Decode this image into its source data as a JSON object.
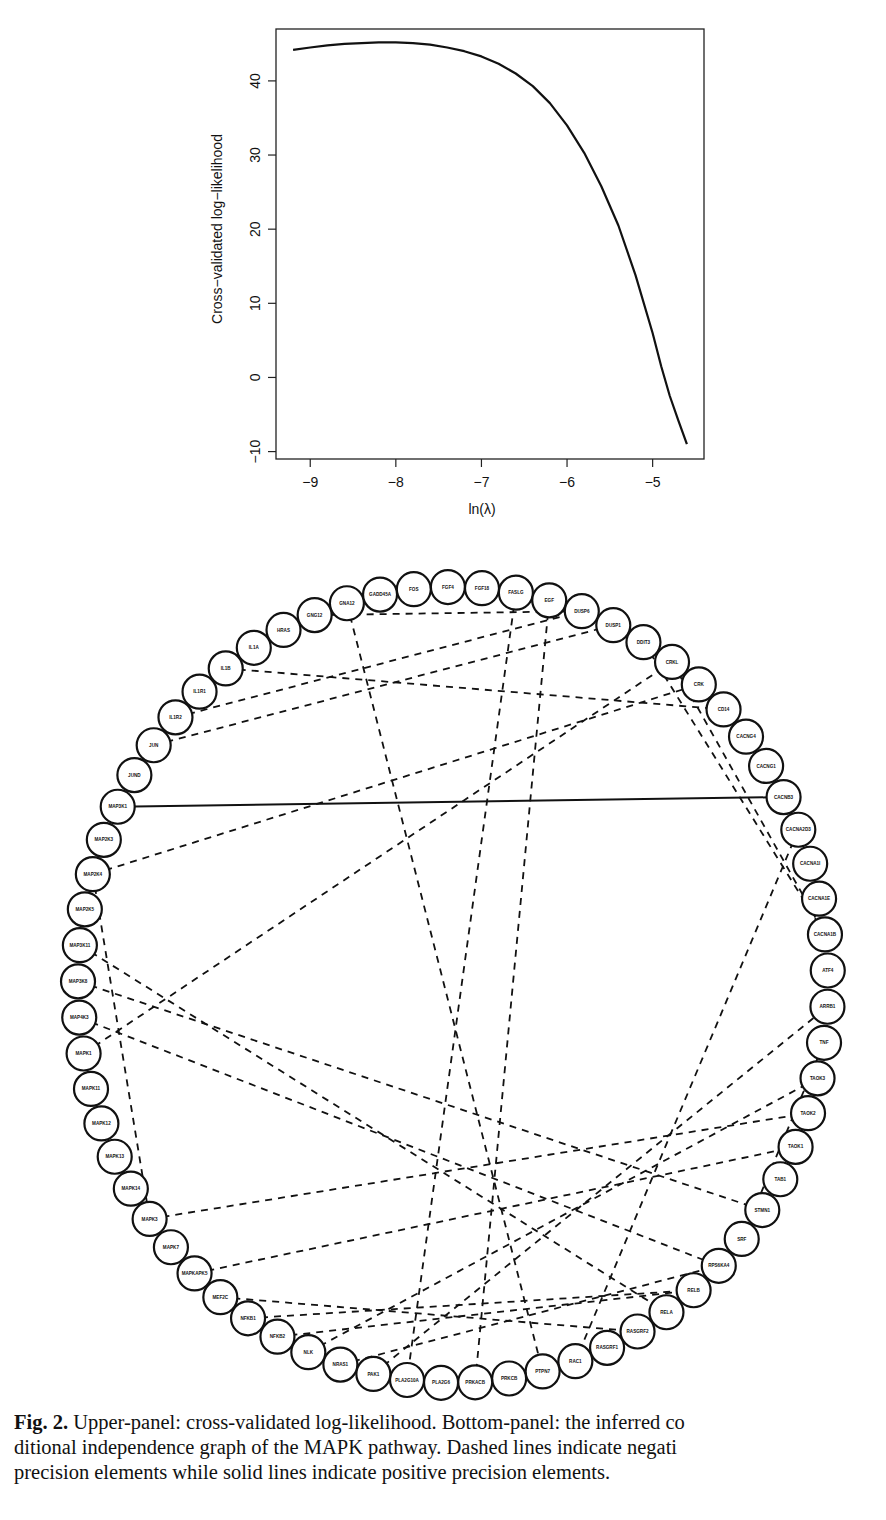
{
  "figure": {
    "label": "Fig. 2.",
    "caption_lines": [
      " Upper-panel: cross-validated log-likelihood. Bottom-panel: the inferred co",
      "ditional independence graph of the MAPK pathway. Dashed lines indicate negati",
      "precision elements while solid lines indicate positive precision elements."
    ]
  },
  "chart_data": [
    {
      "type": "line",
      "title": "",
      "xlabel": "ln(λ)",
      "ylabel": "Cross−validated log−likelihood",
      "xlim": [
        -9.4,
        -4.4
      ],
      "ylim": [
        -11,
        47
      ],
      "xticks": [
        -9,
        -8,
        -7,
        -6,
        -5
      ],
      "xtick_labels": [
        "−9",
        "−8",
        "−7",
        "−6",
        "−5"
      ],
      "yticks": [
        -10,
        0,
        10,
        20,
        30,
        40
      ],
      "ytick_labels": [
        "−10",
        "0",
        "10",
        "20",
        "30",
        "40"
      ],
      "grid": false,
      "series": [
        {
          "name": "cv-loglik",
          "x": [
            -9.2,
            -9.0,
            -8.8,
            -8.6,
            -8.4,
            -8.2,
            -8.0,
            -7.8,
            -7.6,
            -7.4,
            -7.2,
            -7.0,
            -6.8,
            -6.6,
            -6.4,
            -6.2,
            -6.0,
            -5.8,
            -5.6,
            -5.4,
            -5.2,
            -5.0,
            -4.9,
            -4.8,
            -4.7,
            -4.6
          ],
          "y": [
            44.2,
            44.5,
            44.8,
            45.0,
            45.1,
            45.2,
            45.2,
            45.1,
            44.9,
            44.5,
            44.0,
            43.3,
            42.3,
            41.0,
            39.3,
            37.0,
            34.0,
            30.3,
            25.8,
            20.5,
            13.8,
            6.0,
            1.5,
            -2.5,
            -5.8,
            -9.0
          ]
        }
      ]
    },
    {
      "type": "network",
      "title": "Conditional independence graph of the MAPK pathway",
      "legend": {
        "dashed": "negative precision elements",
        "solid": "positive precision elements"
      },
      "nodes": [
        "FOS",
        "FGF4",
        "FGF18",
        "FASLG",
        "EGF",
        "DUSP6",
        "DUSP1",
        "DDIT3",
        "CRKL",
        "CRK",
        "CD14",
        "CACNG4",
        "CACNG1",
        "CACNB3",
        "CACNA2D3",
        "CACNA1I",
        "CACNA1E",
        "CACNA1B",
        "ATF4",
        "ARRB1",
        "TNF",
        "TAOK3",
        "TAOK2",
        "TAOK1",
        "TAB1",
        "STMN1",
        "SRF",
        "RPS6KA4",
        "RELB",
        "RELA",
        "RASGRF2",
        "RASGRF1",
        "RAC1",
        "PTPN7",
        "PRKCB",
        "PRKACB",
        "PLA2G6",
        "PLA2G10A",
        "PAK1",
        "NRAS1",
        "NLK",
        "NFKB2",
        "NFKB1",
        "MEF2C",
        "MAPKAPK5",
        "MAPK7",
        "MAPK3",
        "MAPK14",
        "MAPK13",
        "MAPK12",
        "MAPK11",
        "MAPK1",
        "MAP4K3",
        "MAP3K8",
        "MAP3K11",
        "MAP2K5",
        "MAP2K4",
        "MAP2K3",
        "MAP3K1",
        "JUND",
        "JUN",
        "IL1R2",
        "IL1R1",
        "IL1B",
        "IL1A",
        "HRAS",
        "GNG12",
        "GNA12",
        "GADD45A"
      ],
      "edges": [
        {
          "from": "MAP3K1",
          "to": "CACNB3",
          "style": "solid"
        },
        {
          "from": "GNG12",
          "to": "DUSP6",
          "style": "dashed"
        },
        {
          "from": "GNA12",
          "to": "PTPN7",
          "style": "dashed"
        },
        {
          "from": "FGF4",
          "to": "DUSP6",
          "style": "dashed"
        },
        {
          "from": "FASLG",
          "to": "PLA2G10A",
          "style": "dashed"
        },
        {
          "from": "EGF",
          "to": "PRKACB",
          "style": "dashed"
        },
        {
          "from": "IL1B",
          "to": "CD14",
          "style": "dashed"
        },
        {
          "from": "IL1R2",
          "to": "DUSP6",
          "style": "dashed"
        },
        {
          "from": "JUN",
          "to": "DUSP1",
          "style": "dashed"
        },
        {
          "from": "MAP2K4",
          "to": "CRK",
          "style": "dashed"
        },
        {
          "from": "MAP2K4",
          "to": "MAPK3",
          "style": "dashed"
        },
        {
          "from": "MAPK1",
          "to": "CRKL",
          "style": "dashed"
        },
        {
          "from": "CRKL",
          "to": "CACNA1B",
          "style": "dashed"
        },
        {
          "from": "DDIT3",
          "to": "CACNA1B",
          "style": "dashed"
        },
        {
          "from": "CACNA2D3",
          "to": "RAC1",
          "style": "dashed"
        },
        {
          "from": "MAP3K11",
          "to": "RELA",
          "style": "dashed"
        },
        {
          "from": "MAP3K8",
          "to": "STMN1",
          "style": "dashed"
        },
        {
          "from": "MAP4K3",
          "to": "RPS6KA4",
          "style": "dashed"
        },
        {
          "from": "MAPK3",
          "to": "TAOK2",
          "style": "dashed"
        },
        {
          "from": "MAPKAPK5",
          "to": "TAOK1",
          "style": "dashed"
        },
        {
          "from": "MEF2C",
          "to": "RASGRF2",
          "style": "dashed"
        },
        {
          "from": "NFKB1",
          "to": "RELB",
          "style": "dashed"
        },
        {
          "from": "NFKB2",
          "to": "RELB",
          "style": "dashed"
        },
        {
          "from": "NLK",
          "to": "TAOK3",
          "style": "dashed"
        },
        {
          "from": "NRAS1",
          "to": "RPS6KA4",
          "style": "dashed"
        },
        {
          "from": "PAK1",
          "to": "ARRB1",
          "style": "dashed"
        },
        {
          "from": "TNF",
          "to": "SRF",
          "style": "dashed"
        }
      ]
    }
  ]
}
